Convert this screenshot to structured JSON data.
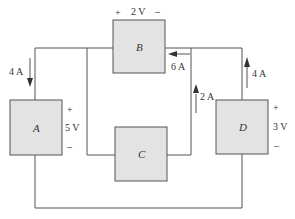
{
  "diagram": {
    "type": "circuit",
    "elements": [
      {
        "id": "A",
        "label": "A",
        "voltage": "5 V",
        "plus": "+",
        "minus": "–"
      },
      {
        "id": "B",
        "label": "B",
        "voltage": "2 V",
        "plus": "+",
        "minus": "–"
      },
      {
        "id": "C",
        "label": "C"
      },
      {
        "id": "D",
        "label": "D",
        "voltage": "3 V",
        "plus": "+",
        "minus": "–"
      }
    ],
    "currents": [
      {
        "id": "iA",
        "label": "4 A",
        "direction": "down"
      },
      {
        "id": "iB",
        "label": "6 A",
        "direction": "left"
      },
      {
        "id": "iC",
        "label": "2 A",
        "direction": "up"
      },
      {
        "id": "iD",
        "label": "4 A",
        "direction": "up"
      }
    ],
    "colors": {
      "box_fill": "#e3e3e3",
      "line": "#555555",
      "text": "#333333"
    }
  }
}
